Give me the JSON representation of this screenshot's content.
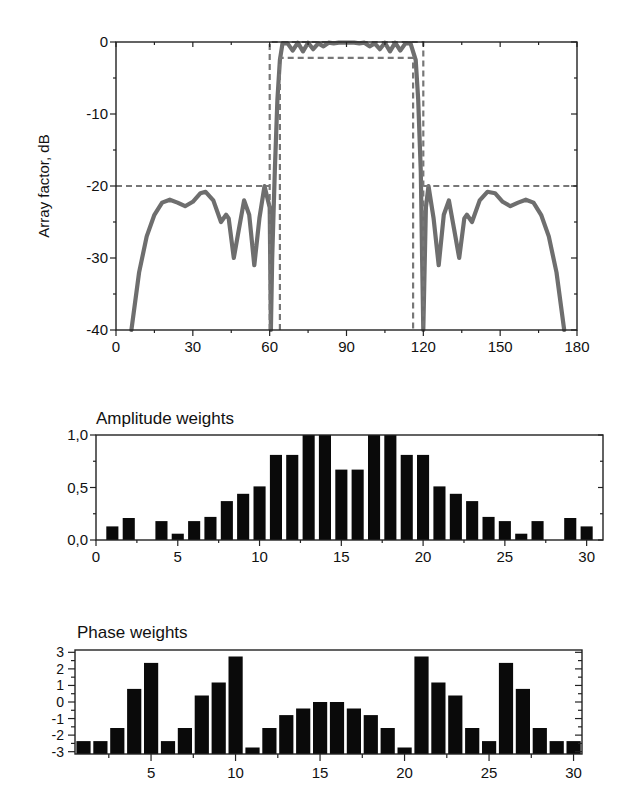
{
  "chart_data": [
    {
      "type": "line",
      "title": "",
      "xlabel": "",
      "ylabel": "Array factor, dB",
      "xlim": [
        0,
        180
      ],
      "ylim": [
        -40,
        0
      ],
      "xticks": [
        0,
        30,
        60,
        90,
        120,
        150,
        180
      ],
      "yticks": [
        0,
        -10,
        -20,
        -30,
        -40
      ],
      "grid": false,
      "series": [
        {
          "name": "Array factor",
          "style": "solid gray thick",
          "x": [
            6,
            9,
            12,
            15,
            18,
            21,
            24,
            27,
            30,
            33,
            35,
            38,
            41,
            43,
            44,
            46,
            48,
            50,
            52,
            54,
            56,
            58,
            60,
            60.5,
            61,
            62,
            63,
            64,
            65,
            67,
            69,
            71,
            73,
            75,
            77,
            79,
            81,
            83,
            85,
            87,
            89,
            91,
            93,
            95,
            97,
            99,
            101,
            103,
            105,
            107,
            109,
            111,
            113,
            115,
            117,
            118,
            119,
            119.5,
            120,
            121,
            122,
            124,
            126,
            128,
            130,
            132,
            134,
            136,
            137,
            139,
            142,
            145,
            148,
            151,
            154,
            157,
            160,
            163,
            166,
            169,
            172,
            175
          ],
          "y": [
            -40,
            -32,
            -27,
            -24,
            -22.3,
            -21.9,
            -22.3,
            -22.8,
            -22.2,
            -21,
            -20.8,
            -22,
            -25,
            -24,
            -24.5,
            -30,
            -26,
            -22,
            -24,
            -31,
            -24.5,
            -20,
            -23,
            -40,
            -30,
            -18,
            -8,
            -2.5,
            -0.2,
            -0.2,
            -1.2,
            -0.1,
            -1.3,
            -0.1,
            -1,
            -0.2,
            -0.6,
            -0.1,
            -0.2,
            -0.1,
            -0.1,
            -0.1,
            -0.1,
            -0.2,
            -0.1,
            -0.6,
            -0.2,
            -1,
            -0.1,
            -1.3,
            -0.1,
            -1.2,
            -0.2,
            -0.2,
            -2.5,
            -8,
            -18,
            -30,
            -40,
            -23,
            -20,
            -24.5,
            -31,
            -24,
            -22,
            -26,
            -30,
            -24.5,
            -24,
            -25,
            -22,
            -20.8,
            -21,
            -22.2,
            -22.8,
            -22.3,
            -21.9,
            -22.3,
            -24,
            -27,
            -32,
            -40
          ]
        },
        {
          "name": "Sidelobe mask left",
          "style": "dashed gray",
          "x": [
            0,
            60
          ],
          "y": [
            -20,
            -20
          ]
        },
        {
          "name": "Sidelobe mask right",
          "style": "dashed gray",
          "x": [
            120,
            180
          ],
          "y": [
            -20,
            -20
          ]
        },
        {
          "name": "Passband outer mask",
          "style": "dashed gray",
          "x": [
            60,
            60,
            120,
            120
          ],
          "y": [
            -40,
            0,
            0,
            -40
          ]
        },
        {
          "name": "Passband inner mask",
          "style": "dashed gray",
          "x": [
            64,
            64,
            116,
            116
          ],
          "y": [
            -40,
            -2.2,
            -2.2,
            -40
          ]
        }
      ]
    },
    {
      "type": "bar",
      "title": "Amplitude weights",
      "xlabel": "",
      "ylabel": "",
      "xlim": [
        0,
        31
      ],
      "ylim": [
        0,
        1
      ],
      "xticks": [
        0,
        5,
        10,
        15,
        20,
        25,
        30
      ],
      "yticks": [
        "0,0",
        "0,5",
        "1,0"
      ],
      "grid": false,
      "categories": [
        1,
        2,
        3,
        4,
        5,
        6,
        7,
        8,
        9,
        10,
        11,
        12,
        13,
        14,
        15,
        16,
        17,
        18,
        19,
        20,
        21,
        22,
        23,
        24,
        25,
        26,
        27,
        28,
        29,
        30
      ],
      "values": [
        0.13,
        0.21,
        0,
        0.18,
        0.06,
        0.18,
        0.22,
        0.37,
        0.44,
        0.51,
        0.81,
        0.81,
        1.0,
        1.0,
        0.67,
        0.67,
        1.0,
        1.0,
        0.81,
        0.81,
        0.51,
        0.44,
        0.37,
        0.22,
        0.18,
        0.06,
        0.18,
        0,
        0.21,
        0.13
      ]
    },
    {
      "type": "bar",
      "title": "Phase weights",
      "xlabel": "",
      "ylabel": "",
      "xlim": [
        0.5,
        30.5
      ],
      "ylim": [
        -3.14,
        3.14
      ],
      "xticks": [
        5,
        10,
        15,
        20,
        25,
        30
      ],
      "yticks": [
        3,
        2,
        1,
        0,
        -1,
        -2,
        -3
      ],
      "grid": false,
      "baseline": -3.14,
      "categories": [
        1,
        2,
        3,
        4,
        5,
        6,
        7,
        8,
        9,
        10,
        11,
        12,
        13,
        14,
        15,
        16,
        17,
        18,
        19,
        20,
        21,
        22,
        23,
        24,
        25,
        26,
        27,
        28,
        29,
        30
      ],
      "values": [
        -2.36,
        -2.36,
        -1.57,
        0.79,
        2.36,
        -2.36,
        -1.57,
        0.39,
        1.18,
        2.75,
        -2.75,
        -1.57,
        -0.79,
        -0.39,
        0,
        0,
        -0.39,
        -0.79,
        -1.57,
        -2.75,
        2.75,
        1.18,
        0.39,
        -1.57,
        -2.36,
        2.36,
        0.79,
        -1.57,
        -2.36,
        -2.36
      ]
    }
  ],
  "labels": {
    "main_ylabel": "Array factor, dB",
    "amp_title": "Amplitude weights",
    "phase_title": "Phase weights"
  }
}
